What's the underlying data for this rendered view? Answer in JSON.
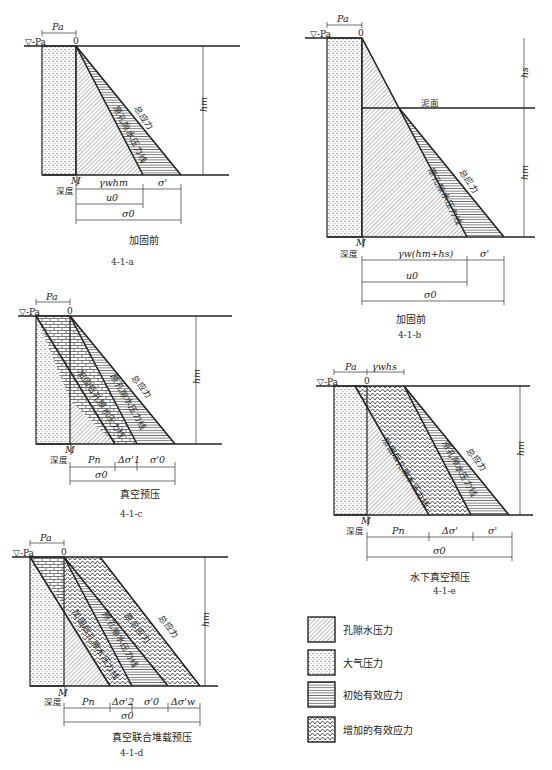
{
  "figure": {
    "panels": [
      {
        "id": "4-1-a",
        "caption": "加固前",
        "number": "4-1-a",
        "top_label": "Pa",
        "water_label": "▽-Pa",
        "origin_label": "0",
        "height_label": "hm",
        "point_label": "M",
        "depth_label": "深度",
        "curve_labels": [
          "总应力",
          "原孔隙水压力线"
        ],
        "dims_row1": [
          "γwhm",
          "σ'"
        ],
        "dims_row2": [
          "u0"
        ],
        "dims_row3": [
          "σ0"
        ]
      },
      {
        "id": "4-1-b",
        "caption": "加固前",
        "number": "4-1-b",
        "top_label": "Pa",
        "water_label": "▽-Pa",
        "origin_label": "0",
        "height_labels": [
          "hs",
          "hm"
        ],
        "mud_label": "泥面",
        "point_label": "M",
        "depth_label": "深度",
        "curve_labels": [
          "总应力",
          "原孔隙水压力线"
        ],
        "dims_row1": [
          "γw(hm+hs)",
          "σ'"
        ],
        "dims_row2": [
          "u0"
        ],
        "dims_row3": [
          "σ0"
        ]
      },
      {
        "id": "4-1-c",
        "caption": "真空预压",
        "number": "4-1-c",
        "top_label": "Pa",
        "water_label": "▽-Pa",
        "origin_label": "0",
        "height_label": "hm",
        "point_label": "M",
        "depth_label": "深度",
        "curve_labels": [
          "加固后孔隙水压力线",
          "原孔隙水压力线",
          "总应力"
        ],
        "dims_row1": [
          "Pn",
          "Δσ'1",
          "σ'0"
        ],
        "dims_row2": [
          "σ0"
        ]
      },
      {
        "id": "4-1-d",
        "caption": "真空联合堆载预压",
        "number": "4-1-d",
        "top_label": "Pa",
        "water_label": "▽-Pa",
        "origin_label": "0",
        "height_label": "hm",
        "point_label": "M",
        "depth_label": "深度",
        "curve_labels": [
          "加固后孔隙水压力线",
          "原孔隙水压力线",
          "原总应力",
          "总应力"
        ],
        "dims_row1": [
          "Pn",
          "Δσ'2",
          "σ'0",
          "Δσ'w"
        ],
        "dims_row2": [
          "σ0"
        ]
      },
      {
        "id": "4-1-e",
        "caption": "水下真空预压",
        "number": "4-1-e",
        "top_labels": [
          "Pa",
          "γwhs"
        ],
        "water_label": "▽-Pa",
        "origin_label": "0",
        "height_label": "hm",
        "point_label": "M",
        "depth_label": "深度",
        "curve_labels": [
          "加固后孔隙水压力线",
          "原孔隙水压力线",
          "总应力"
        ],
        "dims_row1": [
          "Pn",
          "Δσ'",
          "σ'"
        ],
        "dims_row2": [
          "σ0"
        ]
      }
    ],
    "legend": [
      {
        "pattern": "diagonal-hatch",
        "label": "孔隙水压力"
      },
      {
        "pattern": "dots",
        "label": "大气压力"
      },
      {
        "pattern": "horizontal-lines",
        "label": "初始有效应力"
      },
      {
        "pattern": "herringbone",
        "label": "增加的有效应力"
      }
    ]
  }
}
